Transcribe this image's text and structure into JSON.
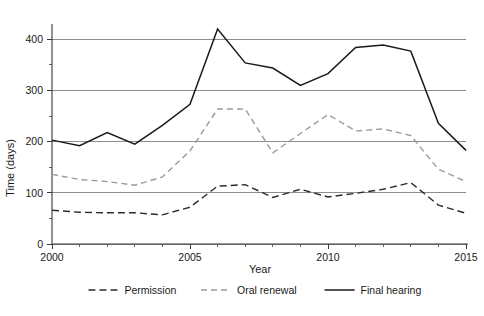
{
  "chart_data": {
    "type": "line",
    "title": "",
    "xlabel": "Year",
    "ylabel": "Time (days)",
    "xlim": [
      2000,
      2015
    ],
    "ylim": [
      0,
      430
    ],
    "grid": true,
    "grid_axis": "y",
    "legend_position": "bottom",
    "x": [
      2000,
      2001,
      2002,
      2003,
      2004,
      2005,
      2006,
      2007,
      2008,
      2009,
      2010,
      2011,
      2012,
      2013,
      2014,
      2015
    ],
    "x_ticks_major": [
      2000,
      2005,
      2010,
      2015
    ],
    "x_tick_labels": [
      "2000",
      "2005",
      "2010",
      "2015"
    ],
    "y_ticks_major": [
      0,
      100,
      200,
      300,
      400
    ],
    "y_tick_labels": [
      "0",
      "100",
      "200",
      "300",
      "400"
    ],
    "y_ticks_minor": [
      50,
      150,
      250,
      350
    ],
    "series": [
      {
        "name": "Permission",
        "style": "dashed",
        "color": "#2b2b2b",
        "values": [
          66,
          62,
          61,
          61,
          57,
          72,
          113,
          116,
          91,
          107,
          92,
          99,
          107,
          120,
          76,
          60
        ]
      },
      {
        "name": "Oral renewal",
        "style": "dashed",
        "color": "#9a9a9a",
        "values": [
          136,
          126,
          122,
          115,
          131,
          182,
          264,
          264,
          178,
          216,
          253,
          221,
          225,
          212,
          146,
          122
        ]
      },
      {
        "name": "Final hearing",
        "style": "solid",
        "color": "#1a1a1a",
        "values": [
          203,
          192,
          218,
          195,
          232,
          273,
          420,
          354,
          344,
          310,
          333,
          384,
          389,
          377,
          236,
          183
        ]
      }
    ]
  },
  "legend": {
    "items": [
      {
        "label": "Permission"
      },
      {
        "label": "Oral renewal"
      },
      {
        "label": "Final hearing"
      }
    ]
  }
}
